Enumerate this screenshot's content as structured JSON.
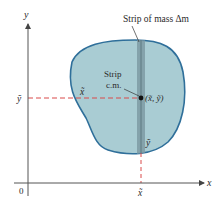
{
  "diagram": {
    "axes": {
      "x_label": "x",
      "y_label": "y",
      "origin_label": "0"
    },
    "labels": {
      "strip_mass": "Strip of mass Δm",
      "strip_cm_line1": "Strip",
      "strip_cm_line2": "c.m.",
      "point_coords": "(x̃, ỹ)",
      "x_tilde_on_dash": "x̃",
      "y_tilde_axis": "ỹ",
      "y_tilde_in_strip": "ỹ",
      "x_tilde_axis": "x̃"
    },
    "colors": {
      "region_fill": "#a9ccd3",
      "region_outline": "#2f6f9a",
      "strip_fill": "#7e9aa3",
      "guide_dash": "#d94a4a",
      "axis": "#555555",
      "point": "#111111"
    }
  }
}
